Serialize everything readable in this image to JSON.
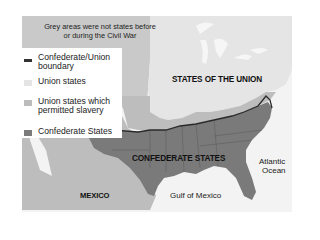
{
  "map": {
    "title_note": "Grey areas were not states before or during the Civil War",
    "colors": {
      "background": "#ffffff",
      "territories": "#c8c8c8",
      "union_states": "#e6e6e6",
      "border_slave_states": "#bcbcbc",
      "confederate_states": "#7a7a7a",
      "mexico": "#bdbdbd",
      "water": "#f4f4f4",
      "boundary": "#2a2a2a"
    },
    "legend": {
      "items": [
        {
          "label": "Confederate/Union boundary",
          "swatch": "line",
          "color": "#333333"
        },
        {
          "label": "Union states",
          "swatch": "box",
          "color": "#e4e4e4"
        },
        {
          "label": "Union states which permitted slavery",
          "swatch": "box",
          "color": "#bcbcbc"
        },
        {
          "label": "Confederate States",
          "swatch": "box",
          "color": "#7a7a7a"
        }
      ]
    },
    "labels": {
      "union": "STATES OF THE UNION",
      "confederate": "CONFEDERATE STATES",
      "mexico": "MEXICO",
      "gulf": "Gulf of Mexico",
      "atlantic_line1": "Atlantic",
      "atlantic_line2": "Ocean"
    }
  }
}
